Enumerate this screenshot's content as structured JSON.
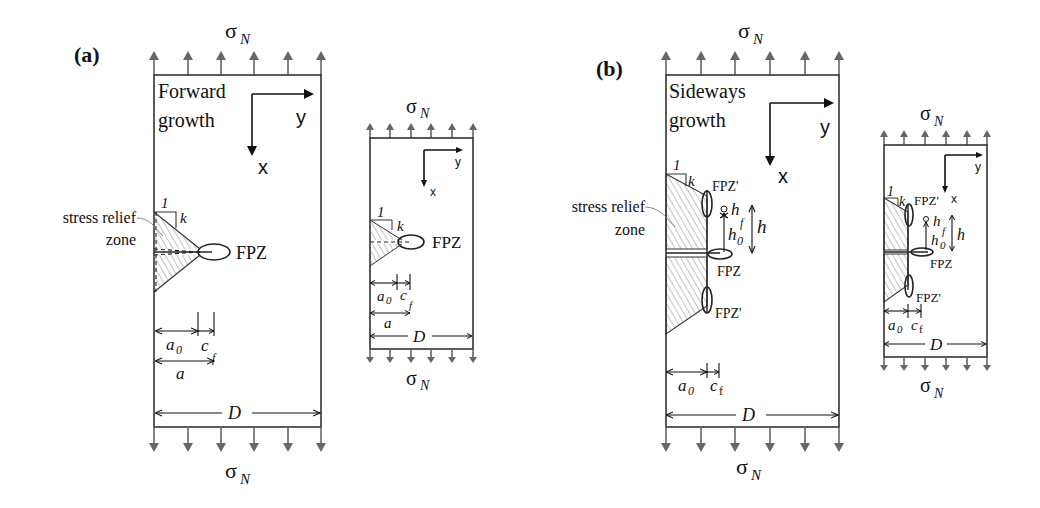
{
  "figure": {
    "panels": [
      {
        "id": "a",
        "label": "(a)",
        "growth_text_line1": "Forward",
        "growth_text_line2": "growth",
        "stress_top": "σ",
        "stress_sub": "N",
        "stress_bottom": "σ",
        "axis_x": "x",
        "axis_y": "y",
        "relief_label_line1": "stress relief",
        "relief_label_line2": "zone",
        "slope_run": "1",
        "slope_rise": "k",
        "fpz": "FPZ",
        "dim_a0": "a",
        "dim_a0_sub": "0",
        "dim_cf": "c",
        "dim_cf_sub": "f",
        "dim_a": "a",
        "dim_D": "D",
        "scaled_copy": {
          "stress_top": "σ",
          "stress_sub": "N",
          "axis_x": "x",
          "axis_y": "y",
          "slope_run": "1",
          "slope_rise": "k",
          "fpz": "FPZ",
          "dim_a0": "a",
          "dim_a0_sub": "0",
          "dim_cf": "c",
          "dim_cf_sub": "f",
          "dim_a": "a",
          "dim_D": "D",
          "stress_bottom": "σ"
        }
      },
      {
        "id": "b",
        "label": "(b)",
        "growth_text_line1": "Sideways",
        "growth_text_line2": "growth",
        "stress_top": "σ",
        "stress_sub": "N",
        "stress_bottom": "σ",
        "axis_x": "x",
        "axis_y": "y",
        "relief_label_line1": "stress relief",
        "relief_label_line2": "zone",
        "slope_run": "1",
        "slope_rise": "k",
        "fpz": "FPZ",
        "fpz_side": "FPZ'",
        "dim_h": "h",
        "dim_hf": "h",
        "dim_hf_sub": "f",
        "dim_h0": "h",
        "dim_h0_sub": "0",
        "dim_a0": "a",
        "dim_a0_sub": "0",
        "dim_cf": "c",
        "dim_cf_sub": "f",
        "dim_D": "D",
        "scaled_copy": {
          "stress_top": "σ",
          "stress_sub": "N",
          "axis_x": "x",
          "axis_y": "y",
          "slope_run": "1",
          "slope_rise": "k",
          "fpz": "FPZ",
          "fpz_side": "FPZ'",
          "dim_h": "h",
          "dim_hf": "h",
          "dim_hf_sub": "f",
          "dim_h0": "h",
          "dim_h0_sub": "0",
          "dim_a0": "a",
          "dim_a0_sub": "0",
          "dim_cf": "c",
          "dim_cf_sub": "f",
          "dim_D": "D",
          "stress_bottom": "σ"
        }
      }
    ]
  }
}
